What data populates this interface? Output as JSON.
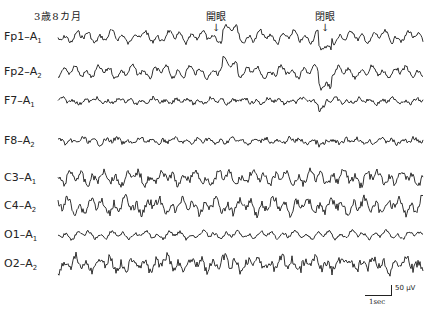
{
  "figure": {
    "caption": "3歳8カ月",
    "markers": [
      {
        "label": "開眼",
        "x": 216,
        "meaning": "eyes open"
      },
      {
        "label": "閉眼",
        "x": 325,
        "meaning": "eyes closed"
      }
    ],
    "scale": {
      "time": "1sec",
      "amplitude": "50 μV"
    },
    "trace_color": "#1a1a1a",
    "channels": [
      {
        "electrode": "Fp1",
        "ref": "A",
        "ref_sub": "1",
        "baseline_y": 37,
        "amp": 6,
        "noise": 0.7,
        "events": "eo_ec"
      },
      {
        "electrode": "Fp2",
        "ref": "A",
        "ref_sub": "2",
        "baseline_y": 72,
        "amp": 6,
        "noise": 0.7,
        "events": "eo_ec"
      },
      {
        "electrode": "F7",
        "ref": "A",
        "ref_sub": "1",
        "baseline_y": 101,
        "amp": 3,
        "noise": 1.2,
        "events": "small"
      },
      {
        "electrode": "F8",
        "ref": "A",
        "ref_sub": "2",
        "baseline_y": 141,
        "amp": 3,
        "noise": 1.4,
        "events": "small"
      },
      {
        "electrode": "C3",
        "ref": "A",
        "ref_sub": "1",
        "baseline_y": 178,
        "amp": 7,
        "noise": 1.0,
        "events": "none"
      },
      {
        "electrode": "C4",
        "ref": "A",
        "ref_sub": "2",
        "baseline_y": 206,
        "amp": 8,
        "noise": 1.0,
        "events": "none"
      },
      {
        "electrode": "O1",
        "ref": "A",
        "ref_sub": "1",
        "baseline_y": 235,
        "amp": 4,
        "noise": 0.8,
        "events": "none"
      },
      {
        "electrode": "O2",
        "ref": "A",
        "ref_sub": "2",
        "baseline_y": 264,
        "amp": 7,
        "noise": 1.3,
        "events": "none"
      }
    ],
    "trace_x_start": 58,
    "trace_x_end": 423
  }
}
